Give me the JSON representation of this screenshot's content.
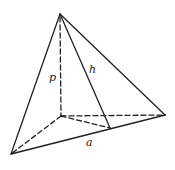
{
  "diagram": {
    "type": "pyramid",
    "colors": {
      "stroke": "#222222",
      "background": "#ffffff"
    },
    "vertices": {
      "apex": [
        60,
        14
      ],
      "base_left": [
        11,
        154
      ],
      "base_right": [
        165,
        115
      ],
      "base_back": [
        61,
        116
      ],
      "slant_foot": [
        110,
        128
      ]
    },
    "labels": {
      "p": "p",
      "h": "h",
      "a": "a"
    }
  }
}
